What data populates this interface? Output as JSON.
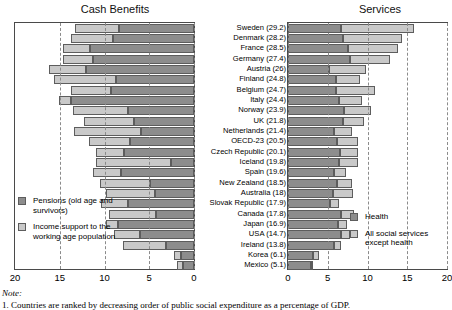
{
  "titles": {
    "left": "Cash Benefits",
    "right": "Services"
  },
  "note": {
    "head": "Note:",
    "body": "1. Countries are ranked by decreasing order of public social expenditure as a percentage of GDP."
  },
  "legend_left": [
    {
      "key": "pensions",
      "label": "Pensions (old age and survivors)",
      "color": "#8d8d8d"
    },
    {
      "key": "income_support",
      "label": "Income support to the working age population",
      "color": "#c9c9c9"
    }
  ],
  "legend_right": [
    {
      "key": "health",
      "label": "Health",
      "color": "#8d8d8d"
    },
    {
      "key": "other_services",
      "label": "All social services except health",
      "color": "#c9c9c9"
    }
  ],
  "chart_data": {
    "type": "bar",
    "orientation": "horizontal",
    "layout": "back-to-back stacked bars, two panels sharing country axis",
    "grid": true,
    "panels": [
      {
        "name": "Cash Benefits",
        "title": "Cash Benefits",
        "xlabel": "",
        "ylabel": "",
        "xlim": [
          20,
          0
        ],
        "axis_reversed": true,
        "ticks": [
          20,
          15,
          10,
          5,
          0
        ],
        "series": [
          {
            "name": "Pensions (old age and survivors)",
            "color": "#8d8d8d",
            "values": [
              8.4,
              9.0,
              11.6,
              11.3,
              12.1,
              8.7,
              9.3,
              13.8,
              7.4,
              6.7,
              5.9,
              7.2,
              7.8,
              2.6,
              8.2,
              4.9,
              4.4,
              7.4,
              4.3,
              8.5,
              6.0,
              3.1,
              1.5,
              1.2
            ]
          },
          {
            "name": "Income support to the working age population",
            "color": "#c9c9c9",
            "values": [
              4.9,
              4.8,
              3.0,
              3.3,
              4.1,
              7.0,
              4.5,
              1.3,
              6.1,
              5.6,
              7.5,
              4.5,
              3.2,
              8.4,
              3.1,
              5.6,
              5.4,
              3.0,
              5.2,
              1.3,
              2.9,
              4.8,
              0.7,
              0.7
            ]
          }
        ]
      },
      {
        "name": "Services",
        "title": "Services",
        "xlabel": "",
        "ylabel": "",
        "xlim": [
          0,
          20
        ],
        "axis_reversed": false,
        "ticks": [
          0,
          5,
          10,
          15,
          20
        ],
        "series": [
          {
            "name": "Health",
            "color": "#8d8d8d",
            "values": [
              6.7,
              6.9,
              7.6,
              7.8,
              5.1,
              6.0,
              6.1,
              6.4,
              7.0,
              6.9,
              5.8,
              6.2,
              6.5,
              6.4,
              5.8,
              6.2,
              5.6,
              5.3,
              6.7,
              6.3,
              6.7,
              5.8,
              3.1,
              2.9
            ]
          },
          {
            "name": "All social services except health",
            "color": "#c9c9c9",
            "values": [
              9.2,
              7.5,
              6.3,
              5.0,
              4.7,
              3.1,
              4.8,
              2.9,
              3.4,
              2.6,
              2.2,
              2.6,
              2.3,
              2.4,
              1.5,
              1.9,
              2.6,
              1.1,
              1.6,
              1.1,
              1.1,
              0.9,
              0.8,
              0.3
            ]
          }
        ]
      }
    ],
    "categories": [
      {
        "label": "Sweden (29.2)",
        "total": 29.2
      },
      {
        "label": "Denmark (28.2)",
        "total": 28.2
      },
      {
        "label": "France (28.5)",
        "total": 28.5
      },
      {
        "label": "Germany (27.4)",
        "total": 27.4
      },
      {
        "label": "Austria (26)",
        "total": 26
      },
      {
        "label": "Finland (24.8)",
        "total": 24.8
      },
      {
        "label": "Belgium (24.7)",
        "total": 24.7
      },
      {
        "label": "Italy (24.4)",
        "total": 24.4
      },
      {
        "label": "Norway (23.9)",
        "total": 23.9
      },
      {
        "label": "UK (21.8)",
        "total": 21.8
      },
      {
        "label": "Netherlands (21.4)",
        "total": 21.4
      },
      {
        "label": "OECD-23 (20.5)",
        "total": 20.5
      },
      {
        "label": "Czech Republic (20.1)",
        "total": 20.1
      },
      {
        "label": "Iceland (19.8)",
        "total": 19.8
      },
      {
        "label": "Spain (19.6)",
        "total": 19.6
      },
      {
        "label": "New Zealand (18.5)",
        "total": 18.5
      },
      {
        "label": "Australia (18)",
        "total": 18
      },
      {
        "label": "Slovak Republic (17.9)",
        "total": 17.9
      },
      {
        "label": "Canada (17.8)",
        "total": 17.8
      },
      {
        "label": "Japan (16.9)",
        "total": 16.9
      },
      {
        "label": "USA (14.7)",
        "total": 14.7
      },
      {
        "label": "Ireland (13.8)",
        "total": 13.8
      },
      {
        "label": "Korea (6.1)",
        "total": 6.1
      },
      {
        "label": "Mexico (5.1)",
        "total": 5.1
      }
    ]
  }
}
